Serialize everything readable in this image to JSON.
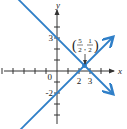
{
  "diagram": {
    "type": "coordinate-plane",
    "axes": {
      "x_label": "x",
      "y_label": "y",
      "x_range": [
        -5,
        5
      ],
      "y_range": [
        -4,
        5
      ]
    },
    "tick_labels": {
      "origin": "0",
      "x": [
        {
          "value": 2,
          "label": "2"
        },
        {
          "value": 3,
          "label": "3"
        }
      ],
      "y": [
        {
          "value": 3,
          "label": "3"
        },
        {
          "value": -2,
          "label": "-2"
        }
      ]
    },
    "lines": [
      {
        "name": "line-decreasing",
        "equation": "y = -x + 3",
        "slope": -1,
        "intercept": 3,
        "color": "#2f7fc8"
      },
      {
        "name": "line-increasing",
        "equation": "y = x - 2",
        "slope": 1,
        "intercept": -2,
        "color": "#2f7fc8"
      }
    ],
    "intersection": {
      "x": 2.5,
      "y": 0.5,
      "label_num_x": "5",
      "label_den_x": "2",
      "label_num_y": "1",
      "label_den_y": "2"
    }
  }
}
